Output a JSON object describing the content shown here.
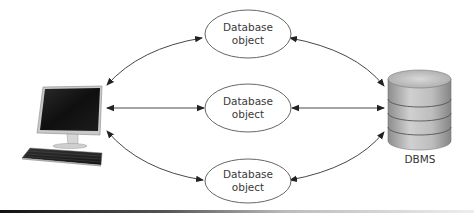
{
  "diagram": {
    "type": "client-server architecture",
    "nodes": {
      "client": {
        "icon": "desktop-computer-icon",
        "label": ""
      },
      "objects": [
        {
          "label_line1": "Database",
          "label_line2": "object"
        },
        {
          "label_line1": "Database",
          "label_line2": "object"
        },
        {
          "label_line1": "Database",
          "label_line2": "object"
        }
      ],
      "server": {
        "icon": "database-cylinder-icon",
        "label": "DBMS"
      }
    },
    "edges": [
      {
        "from": "client",
        "to": "objects.0",
        "bidirectional": true
      },
      {
        "from": "client",
        "to": "objects.1",
        "bidirectional": true
      },
      {
        "from": "client",
        "to": "objects.2",
        "bidirectional": true
      },
      {
        "from": "objects.0",
        "to": "server",
        "bidirectional": true
      },
      {
        "from": "objects.1",
        "to": "server",
        "bidirectional": true
      },
      {
        "from": "objects.2",
        "to": "server",
        "bidirectional": true
      }
    ],
    "colors": {
      "line": "#333333",
      "ellipse_stroke": "#555555",
      "cylinder_fill": "#b8b8b8",
      "monitor_screen": "#1a1a1a"
    }
  }
}
